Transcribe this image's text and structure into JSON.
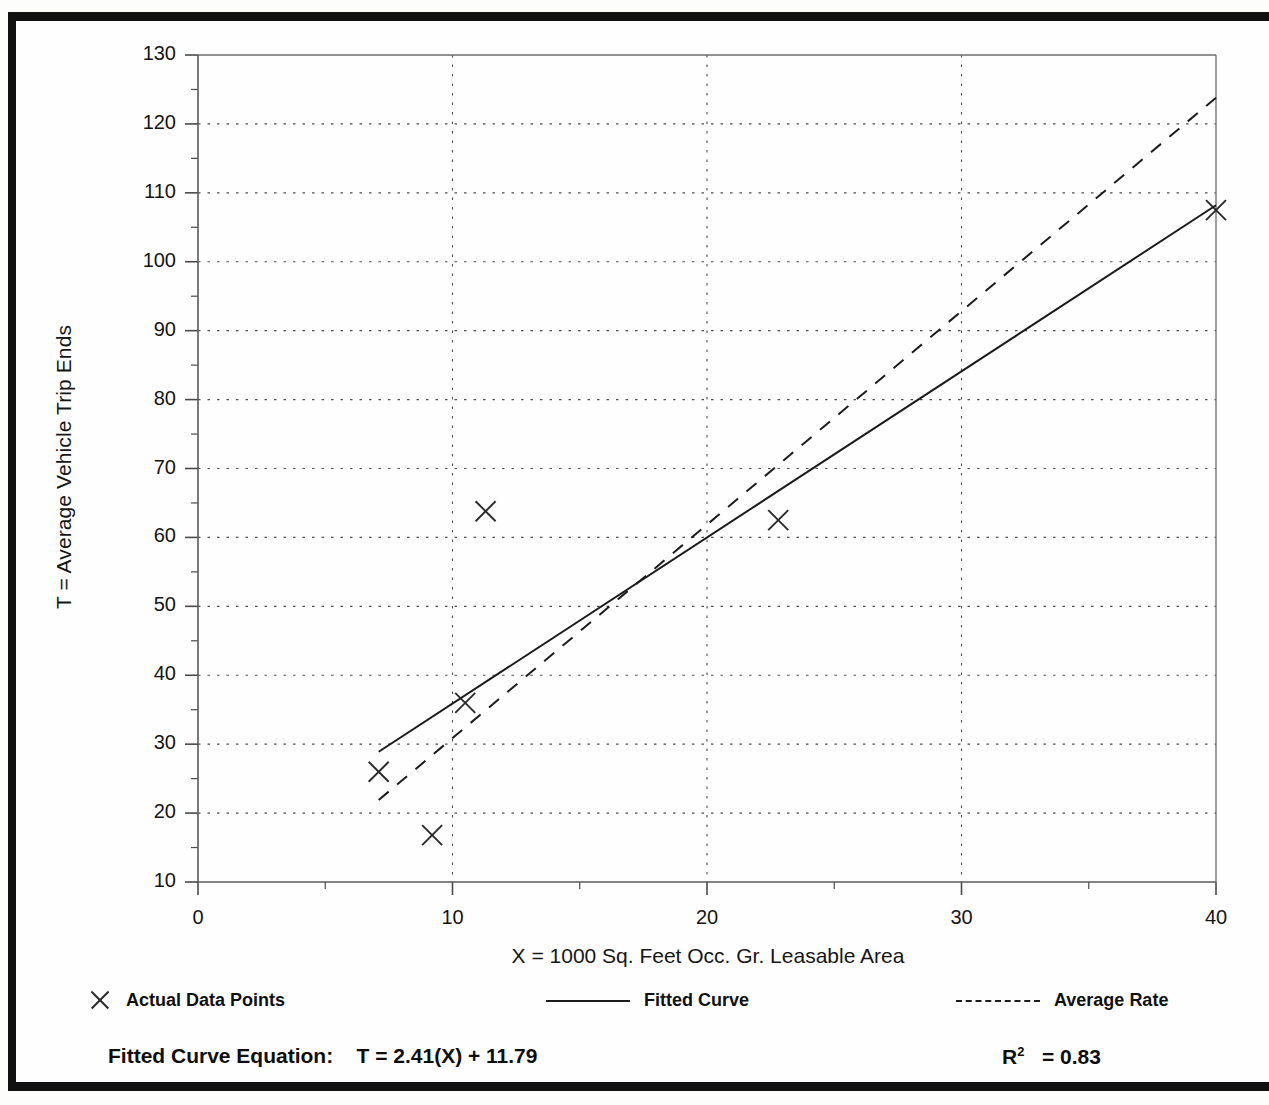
{
  "figure": {
    "y_axis_title": "T = Average Vehicle Trip Ends",
    "x_axis_title": "X = 1000 Sq. Feet Occ. Gr. Leasable Area"
  },
  "legend": {
    "actual": {
      "label": "Actual Data Points",
      "marker": "x-marker-icon"
    },
    "fitted": {
      "label": "Fitted Curve",
      "marker": "solid-line-icon"
    },
    "average": {
      "label": "Average Rate",
      "marker": "dashed-line-icon"
    }
  },
  "equation": {
    "fitted_label": "Fitted Curve Equation:",
    "fitted_formula": "T = 2.41(X) + 11.79",
    "r2_symbol": "R",
    "r2_exponent": "2",
    "r2_value": "= 0.83"
  },
  "chart_data": {
    "type": "scatter",
    "title": "",
    "xlabel": "X = 1000 Sq. Feet Occ. Gr. Leasable Area",
    "ylabel": "T = Average Vehicle Trip Ends",
    "xlim": [
      0,
      40
    ],
    "ylim": [
      10,
      130
    ],
    "xticks": [
      0,
      10,
      20,
      30,
      40
    ],
    "yticks": [
      10,
      20,
      30,
      40,
      50,
      60,
      70,
      80,
      90,
      100,
      110,
      120,
      130
    ],
    "xtick_labels": [
      "0",
      "10",
      "20",
      "30",
      "40"
    ],
    "ytick_labels": [
      "10",
      "20",
      "30",
      "40",
      "50",
      "60",
      "70",
      "80",
      "90",
      "100",
      "110",
      "120",
      "130"
    ],
    "x_minor_step": 5,
    "y_minor_step": 5,
    "grid": true,
    "grid_style": "dotted",
    "legend_position": "below-axes",
    "series": [
      {
        "name": "Actual Data Points",
        "type": "scatter",
        "marker": "x",
        "color": "#2a2a2a",
        "points": [
          {
            "x": 7.1,
            "y": 26.0
          },
          {
            "x": 9.2,
            "y": 16.8
          },
          {
            "x": 10.5,
            "y": 36.0
          },
          {
            "x": 11.3,
            "y": 63.8
          },
          {
            "x": 22.8,
            "y": 62.5
          },
          {
            "x": 40.0,
            "y": 107.5
          }
        ]
      },
      {
        "name": "Fitted Curve",
        "type": "line",
        "style": "solid",
        "color": "#1c1c1c",
        "equation": "T = 2.41(X) + 11.79",
        "slope": 2.41,
        "intercept": 11.79,
        "r_squared": 0.83,
        "endpoints": [
          {
            "x": 7.1,
            "y": 28.9
          },
          {
            "x": 40.0,
            "y": 108.2
          }
        ]
      },
      {
        "name": "Average Rate",
        "type": "line",
        "style": "dashed",
        "color": "#1c1c1c",
        "endpoints": [
          {
            "x": 7.1,
            "y": 21.9
          },
          {
            "x": 40.0,
            "y": 123.8
          }
        ]
      }
    ]
  }
}
